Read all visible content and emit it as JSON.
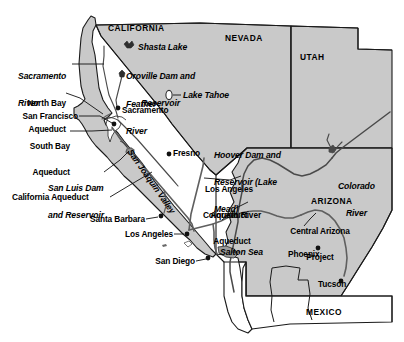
{
  "map": {
    "title": "Western United States Water Projects Map",
    "colors": {
      "land_shaded": "#c9c9c9",
      "land_unshaded": "#ffffff",
      "outline": "#000000",
      "water_line": "#555555",
      "aqueduct": "#666666",
      "text": "#000000",
      "background": "#ffffff"
    },
    "states": [
      {
        "name": "CALIFORNIA",
        "x": 108,
        "y": 28
      },
      {
        "name": "NEVADA",
        "x": 225,
        "y": 38
      },
      {
        "name": "UTAH",
        "x": 300,
        "y": 57
      },
      {
        "name": "ARIZONA",
        "x": 311,
        "y": 201
      },
      {
        "name": "MEXICO",
        "x": 306,
        "y": 312
      }
    ],
    "features": [
      {
        "name": "Sacramento River",
        "style": "italic",
        "x": 18,
        "y": 58,
        "lines": [
          "Sacramento",
          "River"
        ]
      },
      {
        "name": "Shasta Lake",
        "style": "italic",
        "x": 138,
        "y": 47,
        "lines": [
          "Shasta Lake"
        ]
      },
      {
        "name": "Oroville Dam and Reservoir",
        "style": "italic",
        "x": 126,
        "y": 58,
        "lines": [
          "Oroville Dam and",
          "Reservoir"
        ]
      },
      {
        "name": "Feather River",
        "style": "italic",
        "x": 126,
        "y": 86,
        "lines": [
          "Feather",
          "River"
        ]
      },
      {
        "name": "Lake Tahoe",
        "style": "italic",
        "x": 183,
        "y": 94,
        "lines": [
          "Lake Tahoe"
        ]
      },
      {
        "name": "Hoover Dam and Reservoir (Lake Mead)",
        "style": "italic",
        "x": 214,
        "y": 137,
        "lines": [
          "Hoover Dam and",
          "Reservoir (Lake",
          "Mead)"
        ]
      },
      {
        "name": "San Luis Dam and Reservoir",
        "style": "italic",
        "x": 48,
        "y": 170,
        "lines": [
          "San Luis Dam",
          "and Reservoir"
        ]
      },
      {
        "name": "San Joaquin Valley",
        "style": "italic-rotated",
        "x": 147,
        "y": 150,
        "lines": [
          "San Joaquin Valley"
        ]
      },
      {
        "name": "Colorado River",
        "style": "italic",
        "x": 338,
        "y": 168,
        "lines": [
          "Colorado",
          "River"
        ]
      },
      {
        "name": "Salton Sea",
        "style": "italic",
        "x": 220,
        "y": 252,
        "lines": [
          "Salton Sea"
        ]
      }
    ],
    "aqueducts": [
      {
        "name": "North Bay Aqueduct",
        "x": 21,
        "y": 86,
        "lines": [
          "North Bay",
          "Aqueduct"
        ]
      },
      {
        "name": "South Bay Aqueduct",
        "x": 32,
        "y": 129,
        "lines": [
          "South Bay",
          "Aqueduct"
        ]
      },
      {
        "name": "California Aqueduct",
        "x": 12,
        "y": 197,
        "lines": [
          "California Aqueduct"
        ]
      },
      {
        "name": "Los Angeles Aqueduct",
        "x": 203,
        "y": 172,
        "lines": [
          "Los Angeles",
          "Aqueduct"
        ]
      },
      {
        "name": "Colorado River Aqueduct",
        "x": 200,
        "y": 198,
        "lines": [
          "Colorado River",
          "Aqueduct"
        ]
      },
      {
        "name": "Central Arizona Project",
        "x": 285,
        "y": 214,
        "lines": [
          "Central Arizona",
          "Project"
        ]
      }
    ],
    "cities": [
      {
        "name": "Sacramento",
        "label_x": 122,
        "label_y": 110,
        "dot_x": 118,
        "dot_y": 108
      },
      {
        "name": "San Francisco",
        "label_x": 21,
        "label_y": 110,
        "dot_x": 114,
        "dot_y": 124
      },
      {
        "name": "Fresno",
        "label_x": 173,
        "label_y": 152,
        "dot_x": 169,
        "dot_y": 154
      },
      {
        "name": "Santa Barbara",
        "label_x": 90,
        "label_y": 219,
        "dot_x": 161,
        "dot_y": 216
      },
      {
        "name": "Los Angeles",
        "label_x": 119,
        "label_y": 234,
        "dot_x": 187,
        "dot_y": 234
      },
      {
        "name": "San Diego",
        "label_x": 148,
        "label_y": 261,
        "dot_x": 208,
        "dot_y": 258
      },
      {
        "name": "Phoenix",
        "label_x": 290,
        "label_y": 254,
        "dot_x": 318,
        "dot_y": 248
      },
      {
        "name": "Tucson",
        "label_x": 320,
        "label_y": 284,
        "dot_x": 341,
        "dot_y": 281
      }
    ]
  }
}
